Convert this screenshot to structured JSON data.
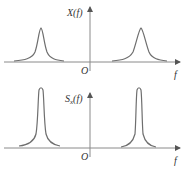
{
  "panels": [
    {
      "id": "top",
      "ylabel": "X(f)",
      "origin_label": "O",
      "xlabel": "f",
      "description": "Spectrum X(f): two broad symmetric peaks about the vertical axis"
    },
    {
      "id": "bottom",
      "ylabel_main": "S",
      "ylabel_sub": "x",
      "ylabel_tail": "(f)",
      "origin_label": "O",
      "xlabel": "f",
      "description": "Power spectral density S_x(f): two narrow, taller peaks at the same frequencies"
    }
  ],
  "colors": {
    "line": "#6e6e6e",
    "axis": "#8a8a8a",
    "text": "#333333"
  }
}
